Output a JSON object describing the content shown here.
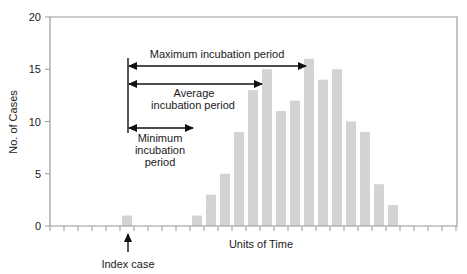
{
  "chart_data": {
    "type": "bar",
    "title": "",
    "xlabel": "Units of Time",
    "ylabel": "No. of Cases",
    "ylim": [
      0,
      20
    ],
    "yticks": [
      0,
      5,
      10,
      15,
      20
    ],
    "grid": false,
    "legend": null,
    "x": [
      0,
      1,
      2,
      3,
      4,
      5,
      6,
      7,
      8,
      9,
      10,
      11,
      12,
      13,
      14,
      15,
      16,
      17,
      18,
      19,
      20,
      21,
      22,
      23,
      24,
      25,
      26,
      27,
      28
    ],
    "values": [
      0,
      0,
      0,
      0,
      0,
      1,
      0,
      0,
      0,
      0,
      1,
      3,
      5,
      9,
      13,
      15,
      11,
      12,
      16,
      14,
      15,
      10,
      9,
      4,
      2,
      0,
      0,
      0,
      0
    ],
    "bar_color": "#d3d3d3",
    "annotations": [
      {
        "text": "Index case",
        "type": "arrow-up",
        "x": 5
      },
      {
        "text": "Minimum incubation period",
        "lines": [
          "Minimum",
          "incubation",
          "period"
        ],
        "type": "double-arrow",
        "from_x": 5,
        "to_x": 10
      },
      {
        "text": "Average incubation period",
        "lines": [
          "Average",
          "incubation period"
        ],
        "type": "double-arrow",
        "from_x": 5,
        "to_x": 14
      },
      {
        "text": "Maximum incubation period",
        "lines": [
          "Maximum incubation period"
        ],
        "type": "double-arrow",
        "from_x": 5,
        "to_x": 18
      }
    ]
  },
  "labels": {
    "xlabel": "Units of Time",
    "ylabel": "No. of Cases",
    "index_case": "Index case",
    "max_period": "Maximum incubation period",
    "avg_period_1": "Average",
    "avg_period_2": "incubation period",
    "min_period_1": "Minimum",
    "min_period_2": "incubation",
    "min_period_3": "period"
  }
}
